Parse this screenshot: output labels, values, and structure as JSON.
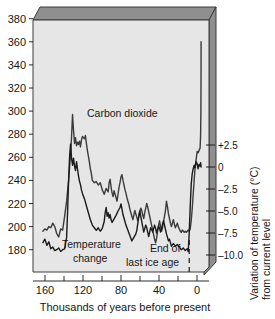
{
  "chart_data": {
    "type": "line",
    "title": "",
    "xlabel": "Thousands of years before present",
    "ylabel_left": "",
    "ylabel_right": "Variation of temperature (°C) from current level",
    "xlim": [
      170,
      -8
    ],
    "x_ticks_major": [
      160,
      120,
      80,
      40,
      0
    ],
    "x_ticks_minor": [
      140,
      100,
      60,
      20
    ],
    "x_tick_labels": [
      "160",
      "120",
      "80",
      "40",
      "0"
    ],
    "y_left_lim": [
      160,
      390
    ],
    "y_left_ticks": [
      180,
      200,
      220,
      240,
      260,
      280,
      300,
      320,
      340,
      360,
      380
    ],
    "y_left_tick_labels": [
      "180",
      "200",
      "220",
      "240",
      "260",
      "280",
      "300",
      "320",
      "340",
      "360",
      "380"
    ],
    "y_right_ticks": [
      2.5,
      0,
      -2.5,
      -5.0,
      -7.5,
      -10.0
    ],
    "y_right_tick_labels": [
      "+2.5",
      "0",
      "–2.5",
      "–5.0",
      "–7.5",
      "–10.0"
    ],
    "grid": false,
    "legend_position": "inline-annotations",
    "annotations": [
      {
        "name": "carbon-dioxide-label",
        "text": "Carbon dioxide",
        "x": 96,
        "y": 272
      },
      {
        "name": "temperature-change-label-line1",
        "text": "Temperature",
        "x": 128,
        "y": 171
      },
      {
        "name": "temperature-change-label-line2",
        "text": "change",
        "x": 124,
        "y": 166
      },
      {
        "name": "end-of-last-ice-age-line1",
        "text": "End of",
        "x": 33,
        "y": 168
      },
      {
        "name": "end-of-last-ice-age-line2",
        "text": "last ice age",
        "x": 34,
        "y": 163
      },
      {
        "name": "ice-age-marker-line",
        "text": "",
        "x": 12,
        "y": 0
      }
    ],
    "series": [
      {
        "name": "Carbon dioxide",
        "unit": "ppm",
        "axis": "left",
        "color": "#3b3b3b",
        "points": [
          [
            160,
            196
          ],
          [
            158,
            198
          ],
          [
            156,
            197
          ],
          [
            154,
            200
          ],
          [
            152,
            199
          ],
          [
            150,
            203
          ],
          [
            148,
            200
          ],
          [
            146,
            194
          ],
          [
            144,
            191
          ],
          [
            142,
            198
          ],
          [
            140,
            197
          ],
          [
            138,
            209
          ],
          [
            136,
            222
          ],
          [
            134,
            240
          ],
          [
            132,
            263
          ],
          [
            131,
            278
          ],
          [
            130,
            297
          ],
          [
            129,
            283
          ],
          [
            128,
            272
          ],
          [
            127,
            277
          ],
          [
            126,
            270
          ],
          [
            125,
            273
          ],
          [
            124,
            271
          ],
          [
            123,
            274
          ],
          [
            122,
            269
          ],
          [
            121,
            275
          ],
          [
            120,
            278
          ],
          [
            119,
            277
          ],
          [
            118,
            276
          ],
          [
            117,
            279
          ],
          [
            116,
            272
          ],
          [
            115,
            266
          ],
          [
            114,
            261
          ],
          [
            113,
            256
          ],
          [
            112,
            250
          ],
          [
            111,
            246
          ],
          [
            110,
            240
          ],
          [
            108,
            238
          ],
          [
            106,
            239
          ],
          [
            104,
            236
          ],
          [
            102,
            238
          ],
          [
            100,
            232
          ],
          [
            98,
            228
          ],
          [
            96,
            233
          ],
          [
            94,
            230
          ],
          [
            93,
            238
          ],
          [
            92,
            241
          ],
          [
            91,
            234
          ],
          [
            90,
            229
          ],
          [
            89,
            226
          ],
          [
            88,
            231
          ],
          [
            87,
            228
          ],
          [
            86,
            225
          ],
          [
            85,
            222
          ],
          [
            84,
            228
          ],
          [
            83,
            234
          ],
          [
            82,
            238
          ],
          [
            81,
            243
          ],
          [
            80,
            245
          ],
          [
            79,
            240
          ],
          [
            78,
            236
          ],
          [
            77,
            232
          ],
          [
            76,
            229
          ],
          [
            75,
            225
          ],
          [
            74,
            222
          ],
          [
            73,
            219
          ],
          [
            72,
            215
          ],
          [
            71,
            212
          ],
          [
            70,
            209
          ],
          [
            69,
            206
          ],
          [
            68,
            210
          ],
          [
            67,
            214
          ],
          [
            66,
            211
          ],
          [
            65,
            208
          ],
          [
            64,
            205
          ],
          [
            63,
            209
          ],
          [
            62,
            213
          ],
          [
            61,
            216
          ],
          [
            60,
            214
          ],
          [
            59,
            210
          ],
          [
            58,
            207
          ],
          [
            57,
            212
          ],
          [
            56,
            216
          ],
          [
            55,
            220
          ],
          [
            54,
            217
          ],
          [
            53,
            213
          ],
          [
            52,
            209
          ],
          [
            51,
            205
          ],
          [
            50,
            201
          ],
          [
            49,
            197
          ],
          [
            48,
            193
          ],
          [
            47,
            189
          ],
          [
            46,
            186
          ],
          [
            45,
            190
          ],
          [
            44,
            196
          ],
          [
            43,
            201
          ],
          [
            42,
            205
          ],
          [
            41,
            200
          ],
          [
            40,
            196
          ],
          [
            39,
            199
          ],
          [
            38,
            204
          ],
          [
            37,
            209
          ],
          [
            36,
            214
          ],
          [
            35,
            222
          ],
          [
            34,
            217
          ],
          [
            33,
            211
          ],
          [
            32,
            207
          ],
          [
            31,
            203
          ],
          [
            30,
            200
          ],
          [
            29,
            203
          ],
          [
            28,
            206
          ],
          [
            27,
            202
          ],
          [
            26,
            199
          ],
          [
            25,
            201
          ],
          [
            24,
            203
          ],
          [
            23,
            200
          ],
          [
            22,
            198
          ],
          [
            21,
            196
          ],
          [
            20,
            195
          ],
          [
            19,
            197
          ],
          [
            18,
            196
          ],
          [
            17,
            195
          ],
          [
            16,
            196
          ],
          [
            15,
            195
          ],
          [
            14,
            196
          ],
          [
            13,
            197
          ],
          [
            12,
            196
          ],
          [
            11,
            198
          ],
          [
            10,
            205
          ],
          [
            9,
            215
          ],
          [
            8,
            228
          ],
          [
            7,
            240
          ],
          [
            6,
            252
          ],
          [
            5,
            258
          ],
          [
            4,
            265
          ],
          [
            3,
            264
          ],
          [
            2,
            266
          ],
          [
            1,
            268
          ],
          [
            0.5,
            279
          ],
          [
            0.2,
            300
          ],
          [
            0.05,
            330
          ],
          [
            0,
            360
          ]
        ]
      },
      {
        "name": "Temperature change",
        "unit": "°C",
        "axis": "right",
        "color": "#1a1a1a",
        "points": [
          [
            160,
            -8.6
          ],
          [
            158,
            -8.2
          ],
          [
            156,
            -8.9
          ],
          [
            154,
            -8.5
          ],
          [
            152,
            -9.3
          ],
          [
            150,
            -9.1
          ],
          [
            148,
            -9.5
          ],
          [
            146,
            -9.4
          ],
          [
            144,
            -9.2
          ],
          [
            142,
            -9.6
          ],
          [
            140,
            -9.4
          ],
          [
            138,
            -9.3
          ],
          [
            136,
            -8.0
          ],
          [
            135,
            -5.0
          ],
          [
            134,
            -1.6
          ],
          [
            133,
            1.2
          ],
          [
            132,
            2.6
          ],
          [
            131,
            1.0
          ],
          [
            130,
            0.2
          ],
          [
            129,
            1.0
          ],
          [
            128,
            0.1
          ],
          [
            127,
            -0.4
          ],
          [
            126,
            0.6
          ],
          [
            125,
            -0.2
          ],
          [
            124,
            -1.0
          ],
          [
            123,
            -1.6
          ],
          [
            122,
            -2.0
          ],
          [
            121,
            -2.6
          ],
          [
            120,
            -3.0
          ],
          [
            118,
            -3.6
          ],
          [
            116,
            -4.4
          ],
          [
            114,
            -5.2
          ],
          [
            112,
            -6.0
          ],
          [
            110,
            -6.6
          ],
          [
            108,
            -6.9
          ],
          [
            106,
            -7.2
          ],
          [
            104,
            -6.9
          ],
          [
            102,
            -7.3
          ],
          [
            100,
            -7.0
          ],
          [
            98,
            -6.2
          ],
          [
            97,
            -5.2
          ],
          [
            96,
            -4.6
          ],
          [
            95,
            -5.6
          ],
          [
            94,
            -5.2
          ],
          [
            93,
            -5.8
          ],
          [
            92,
            -5.4
          ],
          [
            91,
            -6.0
          ],
          [
            90,
            -6.3
          ],
          [
            88,
            -5.9
          ],
          [
            86,
            -5.5
          ],
          [
            84,
            -5.0
          ],
          [
            82,
            -4.6
          ],
          [
            81,
            -4.2
          ],
          [
            80,
            -4.8
          ],
          [
            79,
            -5.4
          ],
          [
            78,
            -5.8
          ],
          [
            77,
            -6.2
          ],
          [
            76,
            -6.6
          ],
          [
            75,
            -6.9
          ],
          [
            74,
            -7.2
          ],
          [
            73,
            -7.5
          ],
          [
            72,
            -7.8
          ],
          [
            71,
            -8.1
          ],
          [
            70,
            -8.4
          ],
          [
            68,
            -8.0
          ],
          [
            66,
            -7.6
          ],
          [
            65,
            -7.2
          ],
          [
            64,
            -6.4
          ],
          [
            63,
            -5.6
          ],
          [
            62,
            -5.0
          ],
          [
            61,
            -5.6
          ],
          [
            60,
            -6.2
          ],
          [
            59,
            -6.8
          ],
          [
            58,
            -7.4
          ],
          [
            57,
            -7.0
          ],
          [
            56,
            -6.6
          ],
          [
            55,
            -6.9
          ],
          [
            54,
            -7.4
          ],
          [
            53,
            -7.9
          ],
          [
            52,
            -7.4
          ],
          [
            51,
            -6.9
          ],
          [
            50,
            -7.1
          ],
          [
            49,
            -7.4
          ],
          [
            48,
            -7.0
          ],
          [
            47,
            -6.6
          ],
          [
            46,
            -7.0
          ],
          [
            45,
            -7.5
          ],
          [
            44,
            -7.1
          ],
          [
            43,
            -6.7
          ],
          [
            42,
            -7.0
          ],
          [
            41,
            -7.4
          ],
          [
            40,
            -7.0
          ],
          [
            39,
            -6.5
          ],
          [
            38,
            -6.1
          ],
          [
            37,
            -6.6
          ],
          [
            36,
            -7.1
          ],
          [
            35,
            -7.6
          ],
          [
            34,
            -8.0
          ],
          [
            33,
            -8.4
          ],
          [
            32,
            -8.2
          ],
          [
            31,
            -8.6
          ],
          [
            30,
            -9.0
          ],
          [
            28,
            -8.7
          ],
          [
            26,
            -9.0
          ],
          [
            24,
            -8.8
          ],
          [
            22,
            -9.1
          ],
          [
            20,
            -9.4
          ],
          [
            18,
            -9.2
          ],
          [
            16,
            -9.5
          ],
          [
            14,
            -9.3
          ],
          [
            13,
            -9.6
          ],
          [
            12,
            -7.5
          ],
          [
            11,
            -4.5
          ],
          [
            10,
            -2.0
          ],
          [
            9,
            -0.8
          ],
          [
            8,
            -0.2
          ],
          [
            7,
            0.2
          ],
          [
            6,
            -0.1
          ],
          [
            5,
            0.6
          ],
          [
            4,
            0.4
          ],
          [
            3,
            -0.2
          ],
          [
            2,
            0.3
          ],
          [
            1,
            0.1
          ],
          [
            0.5,
            0.5
          ],
          [
            0,
            0.0
          ]
        ]
      }
    ],
    "marker_lines": [
      {
        "name": "end-of-ice-age-dashed-line",
        "x": 12,
        "style": "dashed"
      }
    ]
  },
  "colors": {
    "plot_background": "#e6e6e6",
    "box_top_face": "#8f8f8f",
    "box_right_face": "#8f8f8f",
    "box_edge": "#3a3a3a",
    "co2_line": "#4a4a4a",
    "temp_line": "#1a1a1a",
    "text": "#161616",
    "page_background": "#ffffff"
  }
}
